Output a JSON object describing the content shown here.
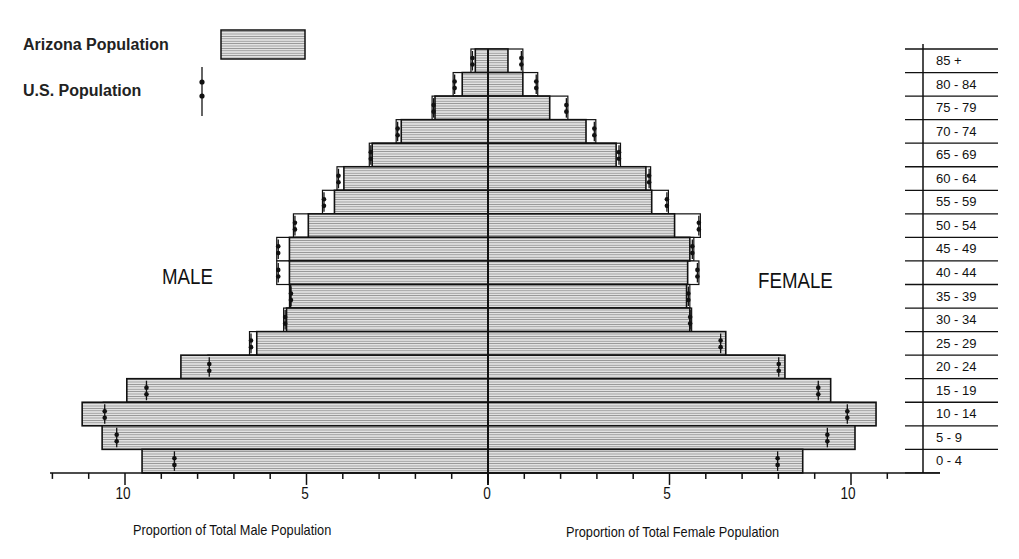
{
  "legend": {
    "arizona_label": "Arizona Population",
    "us_label": "U.S. Population"
  },
  "labels": {
    "male": "MALE",
    "female": "FEMALE",
    "male_axis_title": "Proportion of Total Male Population",
    "female_axis_title": "Proportion of Total Female Population"
  },
  "axis": {
    "male_ticks": [
      "10",
      "5",
      "0"
    ],
    "female_ticks": [
      "5",
      "10"
    ]
  },
  "colors": {
    "bar_fill": "#d8d8d8",
    "bar_stripe": "#9a9a9a",
    "outline": "#111111"
  },
  "chart_data": {
    "type": "bar",
    "subtype": "population-pyramid",
    "title": "",
    "xlabel_left": "Proportion of Total Male Population",
    "xlabel_right": "Proportion of Total Female Population",
    "xlim": [
      0,
      12
    ],
    "x_ticks": [
      0,
      5,
      10
    ],
    "x_minor_tick_step": 1,
    "grid": false,
    "legend_position": "top-left",
    "categories": [
      "85 +",
      "80 - 84",
      "75 - 79",
      "70 - 74",
      "65 - 69",
      "60 - 64",
      "55 - 59",
      "50 - 54",
      "45 - 49",
      "40 - 44",
      "35 - 39",
      "30 - 34",
      "25 - 29",
      "20 - 24",
      "15 - 19",
      "10 - 14",
      "5 - 9",
      "0 - 4"
    ],
    "series": [
      {
        "name": "Arizona Population - Male",
        "side": "left",
        "style": "bar",
        "values": [
          0.35,
          0.71,
          1.46,
          2.39,
          3.19,
          3.97,
          4.23,
          4.95,
          5.47,
          5.47,
          5.44,
          5.55,
          6.37,
          8.46,
          9.95,
          11.18,
          10.63,
          9.53
        ]
      },
      {
        "name": "U.S. Population - Male",
        "side": "left",
        "style": "marker",
        "values": [
          0.47,
          0.96,
          1.54,
          2.53,
          3.27,
          4.16,
          4.56,
          5.36,
          5.82,
          5.82,
          5.47,
          5.63,
          6.57,
          7.72,
          9.45,
          10.6,
          10.27,
          8.68
        ]
      },
      {
        "name": "Arizona Population - Female",
        "side": "right",
        "style": "bar",
        "values": [
          0.55,
          0.96,
          1.7,
          2.7,
          3.53,
          4.35,
          4.51,
          5.14,
          5.56,
          5.5,
          5.47,
          5.56,
          6.55,
          8.18,
          9.44,
          10.69,
          10.11,
          8.67
        ]
      },
      {
        "name": "U.S. Population - Female",
        "side": "right",
        "style": "marker",
        "values": [
          0.96,
          1.37,
          2.2,
          2.97,
          3.65,
          4.48,
          4.97,
          5.85,
          5.67,
          5.81,
          5.56,
          5.61,
          6.45,
          8.05,
          9.14,
          9.94,
          9.39,
          8.02
        ]
      }
    ]
  }
}
